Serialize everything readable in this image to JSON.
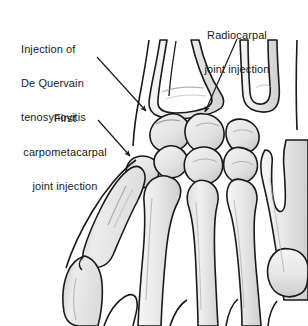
{
  "figure": {
    "background_color": "#ffffff",
    "line_color": "#1a1a1a",
    "bone_fill_light": "#f2f2f2",
    "bone_fill_mid": "#e2e2e2",
    "bone_fill_dark": "#c9c9c9",
    "text_color": "#1a1a1a"
  },
  "labels": [
    {
      "id": "de-quervain",
      "name": "Injection of De Quervain tenosynovitis",
      "lines": [
        "Injection of",
        "De Quervain",
        "tenosynovitis"
      ],
      "align": "left"
    },
    {
      "id": "first-cmc",
      "name": "First carpometacarpal joint injection",
      "lines": [
        "First",
        "carpometacarpal",
        "joint injection"
      ],
      "align": "center"
    },
    {
      "id": "radiocarpal",
      "name": "Radiocarpal joint injection",
      "lines": [
        "Radiocarpal",
        "joint injection"
      ],
      "align": "center"
    }
  ],
  "leaders": [
    {
      "id": "leader-de-quervain",
      "from": [
        97,
        57
      ],
      "to": [
        147,
        112
      ],
      "points_to": "first dorsal compartment / radial styloid"
    },
    {
      "id": "leader-first-cmc",
      "from": [
        98,
        120
      ],
      "to": [
        131,
        157
      ],
      "points_to": "first carpometacarpal joint"
    },
    {
      "id": "leader-radiocarpal",
      "from": [
        237,
        39
      ],
      "to": [
        204,
        113
      ],
      "points_to": "radiocarpal joint line"
    }
  ]
}
